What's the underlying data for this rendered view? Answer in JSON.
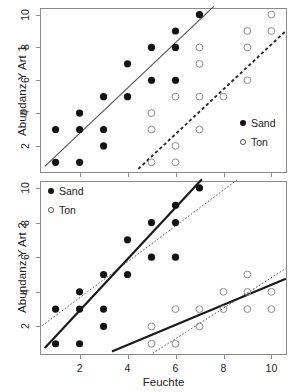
{
  "figure": {
    "background": "#ffffff",
    "sand_color": "#141414",
    "ton_color": "#666666"
  },
  "axis": {
    "xlabel": "Feuchte",
    "xticks": [
      2,
      4,
      6,
      8,
      10
    ],
    "yticks": [
      2,
      4,
      6,
      8,
      10
    ],
    "xlim": [
      0.35,
      10.65
    ],
    "ylim": [
      0.35,
      10.4
    ]
  },
  "legend": {
    "sand_label": "Sand",
    "ton_label": "Ton",
    "sand_marker": "filled-circle-icon",
    "ton_marker": "open-circle-icon"
  },
  "chart_data": [
    {
      "type": "scatter",
      "panel": "top",
      "title": "",
      "ylabel": "Abundanz Y Art 1",
      "xlabel": "",
      "xlim": [
        0.35,
        10.65
      ],
      "ylim": [
        0.35,
        10.4
      ],
      "grid": false,
      "legend_position": "bottom-right",
      "series": [
        {
          "name": "Sand",
          "marker": "filled-circle",
          "color": "#141414",
          "points": [
            [
              1,
              1
            ],
            [
              1,
              3
            ],
            [
              2,
              1
            ],
            [
              2,
              3
            ],
            [
              2,
              4
            ],
            [
              3,
              2
            ],
            [
              3,
              3
            ],
            [
              3,
              5
            ],
            [
              4,
              5
            ],
            [
              4,
              7
            ],
            [
              5,
              6
            ],
            [
              5,
              8
            ],
            [
              6,
              6
            ],
            [
              6,
              8
            ],
            [
              6,
              9
            ],
            [
              7,
              10
            ]
          ],
          "fit": {
            "style": "solid",
            "color": "#555555",
            "x_start": 0.55,
            "y_start": 0.75,
            "x_end": 7.6,
            "y_end": 10.5
          }
        },
        {
          "name": "Ton",
          "marker": "open-circle",
          "color": "#8c8c8c",
          "points": [
            [
              5,
              1
            ],
            [
              5,
              3
            ],
            [
              5,
              4
            ],
            [
              6,
              1
            ],
            [
              6,
              2
            ],
            [
              6,
              5
            ],
            [
              7,
              3
            ],
            [
              7,
              5
            ],
            [
              7,
              7
            ],
            [
              7,
              8
            ],
            [
              8,
              5
            ],
            [
              9,
              6
            ],
            [
              9,
              8
            ],
            [
              9,
              9
            ],
            [
              10,
              9
            ],
            [
              10,
              10
            ]
          ],
          "fit": {
            "style": "dashed",
            "color": "#2b2b2b",
            "x_start": 4.45,
            "y_start": 0.6,
            "x_end": 10.6,
            "y_end": 9.0
          }
        }
      ]
    },
    {
      "type": "scatter",
      "panel": "bottom",
      "title": "",
      "ylabel": "Abundanz Y Art 2",
      "xlabel": "Feuchte",
      "xlim": [
        0.35,
        10.65
      ],
      "ylim": [
        0.35,
        10.4
      ],
      "grid": false,
      "legend_position": "top-left",
      "series": [
        {
          "name": "Sand",
          "marker": "filled-circle",
          "color": "#141414",
          "points": [
            [
              1,
              1
            ],
            [
              1,
              3
            ],
            [
              2,
              1
            ],
            [
              2,
              3
            ],
            [
              2,
              4
            ],
            [
              3,
              2
            ],
            [
              3,
              3
            ],
            [
              3,
              5
            ],
            [
              4,
              5
            ],
            [
              4,
              7
            ],
            [
              5,
              6
            ],
            [
              5,
              8
            ],
            [
              6,
              6
            ],
            [
              6,
              8
            ],
            [
              6,
              9
            ],
            [
              7,
              10
            ]
          ],
          "fit_solid": {
            "style": "solid",
            "color": "#1a1a1a",
            "x_start": 0.55,
            "y_start": 0.75,
            "x_end": 7.1,
            "y_end": 10.5
          },
          "fit_dotted": {
            "style": "dotted",
            "color": "#4d4d4d",
            "x_start": 0.45,
            "y_start": 2.05,
            "x_end": 8.6,
            "y_end": 10.5
          }
        },
        {
          "name": "Ton",
          "marker": "open-circle",
          "color": "#8c8c8c",
          "points": [
            [
              5,
              1
            ],
            [
              5,
              2
            ],
            [
              6,
              1
            ],
            [
              6,
              3
            ],
            [
              7,
              2
            ],
            [
              7,
              3
            ],
            [
              8,
              3
            ],
            [
              8,
              4
            ],
            [
              9,
              3
            ],
            [
              9,
              4
            ],
            [
              9,
              5
            ],
            [
              10,
              3
            ],
            [
              10,
              4
            ]
          ],
          "fit_solid": {
            "style": "solid",
            "color": "#1a1a1a",
            "x_start": 3.35,
            "y_start": 0.55,
            "x_end": 10.6,
            "y_end": 4.75
          },
          "fit_dotted": {
            "style": "dotted",
            "color": "#4d4d4d",
            "x_start": 5.05,
            "y_start": 0.45,
            "x_end": 10.6,
            "y_end": 5.35
          }
        }
      ]
    }
  ]
}
